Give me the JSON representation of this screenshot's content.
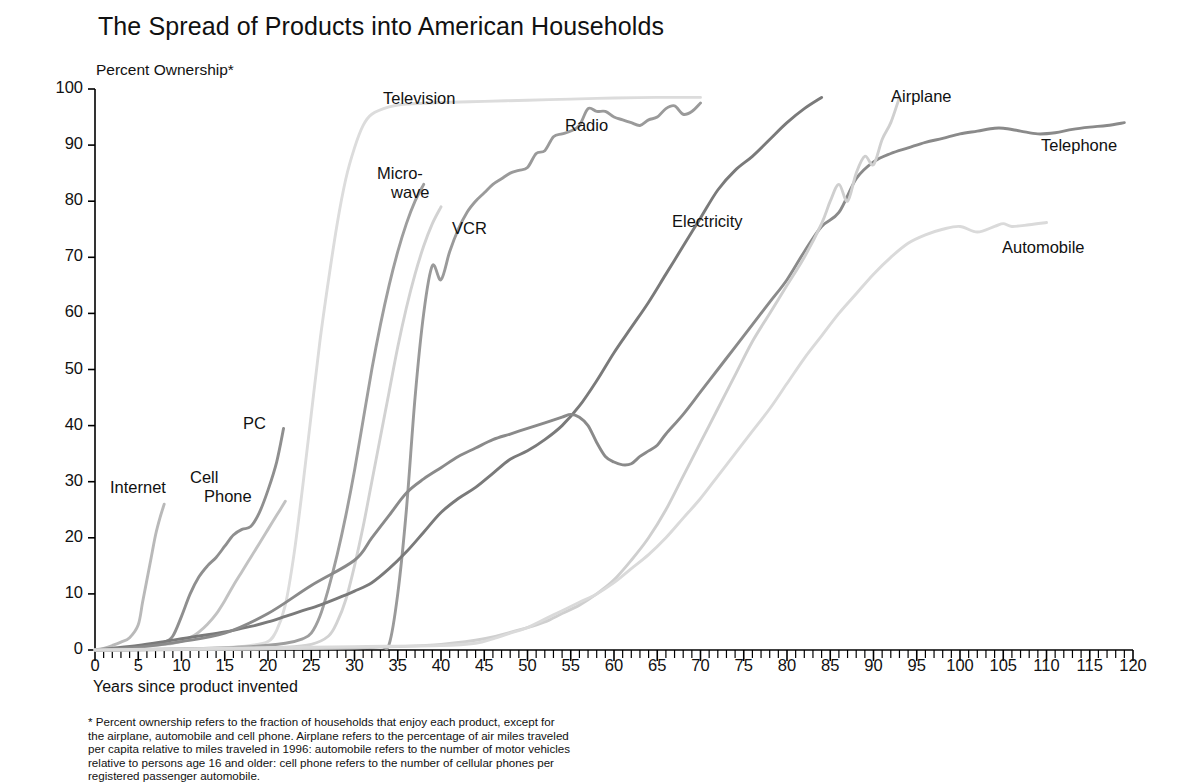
{
  "chart_data": {
    "type": "line",
    "title": "The Spread of Products into  American Households",
    "ylabel": "Percent Ownership*",
    "xlabel": "Years since product invented",
    "xlim": [
      0,
      120
    ],
    "ylim": [
      0,
      100
    ],
    "xticks": [
      0,
      5,
      10,
      15,
      20,
      25,
      30,
      35,
      40,
      45,
      50,
      55,
      60,
      65,
      70,
      75,
      80,
      85,
      90,
      95,
      100,
      105,
      110,
      115,
      120
    ],
    "yticks": [
      0,
      10,
      20,
      30,
      40,
      50,
      60,
      70,
      80,
      90,
      100
    ],
    "minor_xtick_step": 1,
    "grid": false,
    "legend": "inline-labels",
    "footnote": [
      "* Percent ownership refers to the fraction of households that enjoy each product, except for",
      "the airplane, automobile and cell phone.  Airplane refers to the percentage of air miles traveled",
      "per capita relative to miles traveled in 1996: automobile refers to the number of motor vehicles",
      "relative to persons age 16 and older: cell phone refers to the number of cellular phones per",
      "registered passenger automobile."
    ],
    "series": [
      {
        "name": "Internet",
        "label": "Internet",
        "label_lines": [
          "Internet"
        ],
        "color": "#b9b9b9",
        "label_x": 110,
        "label_y": 478,
        "x": [
          0,
          1,
          2,
          3,
          4,
          5,
          5.5,
          6,
          6.5,
          7,
          7.5,
          8
        ],
        "y": [
          0,
          0.3,
          0.8,
          1.4,
          2.2,
          4.5,
          8.5,
          12.5,
          16.5,
          20.5,
          23.5,
          26.0
        ]
      },
      {
        "name": "Cell Phone",
        "label": "Cell Phone",
        "label_lines": [
          "Cell",
          "Phone"
        ],
        "color": "#c2c2c2",
        "label_x": 190,
        "label_y": 468,
        "x": [
          0,
          2,
          4,
          6,
          8,
          9,
          10,
          11,
          12,
          13,
          14,
          15,
          16,
          17,
          18,
          19,
          20,
          21,
          22
        ],
        "y": [
          0,
          0.2,
          0.4,
          0.7,
          1.0,
          1.2,
          1.6,
          2.2,
          3.2,
          4.6,
          6.4,
          8.8,
          11.5,
          14.0,
          16.5,
          19.0,
          21.5,
          24.0,
          26.5
        ]
      },
      {
        "name": "PC",
        "label": "PC",
        "label_lines": [
          "PC"
        ],
        "color": "#8f8f8f",
        "label_x": 243,
        "label_y": 414,
        "x": [
          0,
          2,
          4,
          6,
          8,
          9,
          10,
          11,
          12,
          13,
          14,
          15,
          16,
          17,
          18,
          19,
          20,
          21,
          21.8
        ],
        "y": [
          0,
          0.2,
          0.5,
          0.9,
          1.4,
          2.5,
          6.0,
          10.0,
          13.0,
          15.0,
          16.5,
          18.5,
          20.5,
          21.5,
          22.0,
          24.5,
          28.5,
          33.5,
          39.5
        ]
      },
      {
        "name": "Television",
        "label": "Television",
        "label_lines": [
          "Television"
        ],
        "color": "#dcdcdc",
        "label_x": 383,
        "label_y": 89,
        "x": [
          0,
          10,
          15,
          18,
          20,
          21,
          22,
          23,
          24,
          25,
          26,
          27,
          28,
          29,
          30,
          31,
          32,
          34,
          36,
          40,
          45,
          50,
          55,
          60,
          65,
          70
        ],
        "y": [
          0,
          0.2,
          0.4,
          0.8,
          1.5,
          3.5,
          8.0,
          17.0,
          29.0,
          42.0,
          55.0,
          66.0,
          76.0,
          84.0,
          89.5,
          93.5,
          95.5,
          96.8,
          97.3,
          97.6,
          97.8,
          98.0,
          98.2,
          98.4,
          98.5,
          98.5
        ]
      },
      {
        "name": "Micro-wave",
        "label": "Microwave",
        "label_lines": [
          "Micro-",
          "wave"
        ],
        "color": "#9e9e9e",
        "label_x": 377,
        "label_y": 164,
        "x": [
          0,
          10,
          18,
          22,
          24,
          25,
          26,
          27,
          28,
          29,
          30,
          31,
          32,
          33,
          34,
          35,
          36,
          37,
          38
        ],
        "y": [
          0,
          0.2,
          0.6,
          1.2,
          2.0,
          3.0,
          6.0,
          11.0,
          17.0,
          24.0,
          32.0,
          41.0,
          50.0,
          58.0,
          65.0,
          71.0,
          76.0,
          80.0,
          83.0
        ]
      },
      {
        "name": "VCR",
        "label": "VCR",
        "label_lines": [
          "VCR"
        ],
        "color": "#d2d2d2",
        "label_x": 452,
        "label_y": 219,
        "x": [
          0,
          15,
          22,
          25,
          27,
          28,
          29,
          30,
          31,
          32,
          33,
          34,
          35,
          36,
          37,
          38,
          39,
          40
        ],
        "y": [
          0,
          0.2,
          0.5,
          1.0,
          2.5,
          5.0,
          9.0,
          15.0,
          22.0,
          30.0,
          38.0,
          46.0,
          54.0,
          61.0,
          67.0,
          72.0,
          76.0,
          79.0
        ]
      },
      {
        "name": "Radio",
        "label": "Radio",
        "label_lines": [
          "Radio"
        ],
        "color": "#9a9a9a",
        "label_x": 565,
        "label_y": 116,
        "x": [
          0,
          20,
          30,
          33,
          34,
          35,
          36,
          37,
          38,
          39,
          40,
          41,
          42,
          43,
          44,
          45,
          46,
          47,
          48,
          49,
          50,
          51,
          52,
          53,
          54,
          55,
          56,
          57,
          58,
          59,
          60,
          61,
          62,
          63,
          64,
          65,
          66,
          67,
          68,
          69,
          70
        ],
        "y": [
          0,
          0.2,
          0.4,
          0.6,
          1.0,
          10.0,
          25.0,
          45.0,
          60.0,
          68.5,
          66.0,
          71.0,
          75.0,
          78.0,
          80.0,
          81.5,
          83.0,
          84.0,
          85.0,
          85.5,
          86.0,
          88.5,
          89.0,
          91.5,
          92.0,
          92.5,
          93.5,
          96.5,
          96.0,
          96.0,
          95.0,
          94.5,
          94.0,
          93.5,
          94.5,
          95.0,
          96.5,
          97.0,
          95.5,
          96.0,
          97.5
        ]
      },
      {
        "name": "Electricity",
        "label": "Electricity",
        "label_lines": [
          "Electricity"
        ],
        "color": "#7a7a7a",
        "label_x": 672,
        "label_y": 212,
        "x": [
          0,
          2,
          5,
          8,
          10,
          12,
          15,
          18,
          20,
          22,
          24,
          26,
          28,
          30,
          32,
          34,
          36,
          38,
          40,
          42,
          44,
          46,
          48,
          50,
          52,
          54,
          56,
          58,
          60,
          62,
          64,
          66,
          68,
          70,
          72,
          74,
          76,
          78,
          80,
          82,
          84
        ],
        "y": [
          0,
          0.3,
          0.8,
          1.5,
          2.0,
          2.5,
          3.2,
          4.2,
          5.0,
          6.0,
          7.0,
          8.0,
          9.2,
          10.5,
          12.0,
          14.5,
          17.5,
          21.0,
          24.5,
          27.0,
          29.0,
          31.5,
          34.0,
          35.5,
          37.5,
          40.0,
          43.5,
          48.0,
          53.0,
          57.5,
          62.0,
          67.0,
          72.0,
          77.0,
          82.0,
          85.5,
          88.0,
          91.0,
          94.0,
          96.5,
          98.5
        ]
      },
      {
        "name": "Telephone",
        "label": "Telephone",
        "label_lines": [
          "Telephone"
        ],
        "color": "#8a8a8a",
        "label_x": 1041,
        "label_y": 136,
        "x": [
          0,
          5,
          10,
          15,
          20,
          25,
          30,
          32,
          34,
          36,
          38,
          40,
          42,
          44,
          46,
          48,
          50,
          52,
          54,
          55,
          56,
          57,
          58,
          59,
          60,
          61,
          62,
          63,
          64,
          65,
          66,
          68,
          70,
          72,
          74,
          76,
          78,
          80,
          82,
          84,
          86,
          88,
          90,
          92,
          94,
          96,
          98,
          100,
          102,
          104,
          105,
          107,
          109,
          111,
          113,
          115,
          117,
          119
        ],
        "y": [
          0,
          0.5,
          1.5,
          3.0,
          6.5,
          11.5,
          16.0,
          20.0,
          24.0,
          28.0,
          30.5,
          32.5,
          34.5,
          36.0,
          37.5,
          38.5,
          39.5,
          40.5,
          41.5,
          42.0,
          41.5,
          40.0,
          37.0,
          34.5,
          33.5,
          33.0,
          33.2,
          34.5,
          35.5,
          36.5,
          38.5,
          42.0,
          46.0,
          50.0,
          54.0,
          58.0,
          62.0,
          66.0,
          71.0,
          75.5,
          78.0,
          84.0,
          87.0,
          88.5,
          89.5,
          90.5,
          91.2,
          92.0,
          92.5,
          93.0,
          93.0,
          92.5,
          92.0,
          92.2,
          92.8,
          93.2,
          93.5,
          94.0
        ]
      },
      {
        "name": "Airplane",
        "label": "Airplane",
        "label_lines": [
          "Airplane"
        ],
        "color": "#cfcfcf",
        "label_x": 891,
        "label_y": 87,
        "x": [
          0,
          10,
          20,
          30,
          35,
          40,
          45,
          50,
          52,
          54,
          56,
          58,
          60,
          62,
          64,
          66,
          68,
          70,
          72,
          74,
          76,
          78,
          80,
          82,
          84,
          85,
          86,
          87,
          88,
          89,
          90,
          91,
          92,
          93
        ],
        "y": [
          0,
          0.1,
          0.2,
          0.4,
          0.6,
          1.0,
          2.0,
          4.0,
          5.0,
          6.5,
          8.0,
          10.0,
          12.5,
          16.0,
          20.0,
          25.0,
          31.0,
          37.0,
          43.0,
          49.0,
          55.0,
          60.0,
          65.0,
          70.0,
          76.0,
          80.0,
          83.0,
          80.0,
          85.0,
          88.0,
          86.5,
          91.0,
          94.0,
          98.5
        ]
      },
      {
        "name": "Automobile",
        "label": "Automobile",
        "label_lines": [
          "Automobile"
        ],
        "color": "#dadada",
        "label_x": 1002,
        "label_y": 238,
        "x": [
          0,
          10,
          20,
          30,
          40,
          44,
          46,
          48,
          50,
          52,
          54,
          56,
          58,
          60,
          62,
          64,
          66,
          68,
          70,
          72,
          74,
          76,
          78,
          80,
          82,
          84,
          86,
          88,
          90,
          92,
          94,
          96,
          98,
          100,
          102,
          104,
          105,
          106,
          108,
          110
        ],
        "y": [
          0,
          0.2,
          0.4,
          0.6,
          0.8,
          1.2,
          2.0,
          3.0,
          4.0,
          5.5,
          7.0,
          8.5,
          10.0,
          12.0,
          14.5,
          17.0,
          20.0,
          23.5,
          27.0,
          31.0,
          35.0,
          39.0,
          43.0,
          47.5,
          52.0,
          56.0,
          60.0,
          63.5,
          67.0,
          70.0,
          72.5,
          74.0,
          75.0,
          75.5,
          74.5,
          75.5,
          76.0,
          75.5,
          75.8,
          76.2
        ]
      }
    ]
  }
}
